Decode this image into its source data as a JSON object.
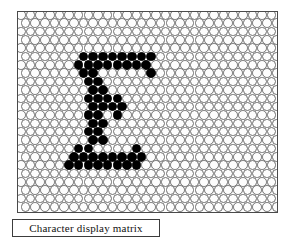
{
  "figure": {
    "caption": "Character display matrix",
    "panel": {
      "name": "dot-matrix-display",
      "border_color": "#4a4a4a",
      "background_color": "#ffffff"
    }
  },
  "matrix": {
    "columns": 27,
    "rows": 24,
    "dot_diameter_px": 9.6,
    "column_pitch_px": 9.65,
    "row_pitch_px": 8.35,
    "row_offset_odd_px": 4.8,
    "on_color": "#000000",
    "off_color": "#fdfdfd",
    "off_outline_color": "#6e6e6e",
    "character": "E",
    "lit_dots": [
      [
        5,
        6
      ],
      [
        5,
        7
      ],
      [
        5,
        8
      ],
      [
        5,
        9
      ],
      [
        5,
        10
      ],
      [
        5,
        11
      ],
      [
        5,
        12
      ],
      [
        5,
        13
      ],
      [
        6,
        6
      ],
      [
        6,
        7
      ],
      [
        6,
        8
      ],
      [
        6,
        9
      ],
      [
        6,
        10
      ],
      [
        6,
        11
      ],
      [
        6,
        12
      ],
      [
        6,
        13
      ],
      [
        7,
        6
      ],
      [
        7,
        7
      ],
      [
        7,
        13
      ],
      [
        8,
        7
      ],
      [
        8,
        8
      ],
      [
        9,
        7
      ],
      [
        9,
        8
      ],
      [
        10,
        7
      ],
      [
        10,
        8
      ],
      [
        10,
        9
      ],
      [
        10,
        10
      ],
      [
        11,
        7
      ],
      [
        11,
        8
      ],
      [
        11,
        9
      ],
      [
        11,
        10
      ],
      [
        12,
        7
      ],
      [
        12,
        8
      ],
      [
        12,
        10
      ],
      [
        13,
        7
      ],
      [
        13,
        8
      ],
      [
        14,
        7
      ],
      [
        14,
        8
      ],
      [
        15,
        7
      ],
      [
        15,
        8
      ],
      [
        16,
        6
      ],
      [
        16,
        7
      ],
      [
        16,
        12
      ],
      [
        17,
        5
      ],
      [
        17,
        6
      ],
      [
        17,
        7
      ],
      [
        17,
        8
      ],
      [
        17,
        9
      ],
      [
        17,
        10
      ],
      [
        17,
        11
      ],
      [
        17,
        12
      ],
      [
        18,
        5
      ],
      [
        18,
        6
      ],
      [
        18,
        7
      ],
      [
        18,
        8
      ],
      [
        18,
        9
      ],
      [
        18,
        10
      ],
      [
        18,
        11
      ],
      [
        18,
        12
      ]
    ]
  },
  "chart_data": {
    "type": "heatmap",
    "title": "Character display matrix",
    "xlabel": "",
    "ylabel": "",
    "grid": true,
    "legend": "none",
    "columns": 27,
    "rows": 24,
    "values_note": "1 = lit (black filled dot), 0 = unlit (open circle)",
    "lit_cell_count": 59,
    "character_rendered": "E"
  }
}
